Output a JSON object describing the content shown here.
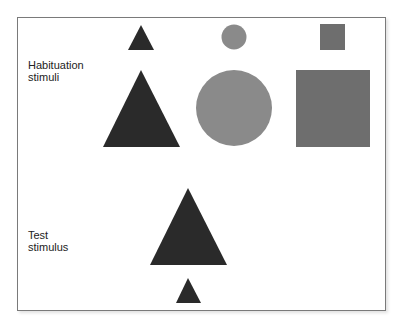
{
  "labels": {
    "habituation": [
      "Habituation",
      "stimuli"
    ],
    "test": [
      "Test",
      "stimulus"
    ]
  },
  "colors": {
    "triangle": "#2a2a2a",
    "circle": "#8a8a8a",
    "square": "#6e6e6e",
    "frame": "#7a7a7a"
  },
  "habituation_stimuli": [
    {
      "shape": "triangle",
      "size": "small"
    },
    {
      "shape": "circle",
      "size": "small"
    },
    {
      "shape": "square",
      "size": "small"
    },
    {
      "shape": "triangle",
      "size": "large"
    },
    {
      "shape": "circle",
      "size": "large"
    },
    {
      "shape": "square",
      "size": "large"
    }
  ],
  "test_stimulus": [
    {
      "shape": "triangle",
      "size": "large"
    },
    {
      "shape": "triangle",
      "size": "small"
    }
  ]
}
